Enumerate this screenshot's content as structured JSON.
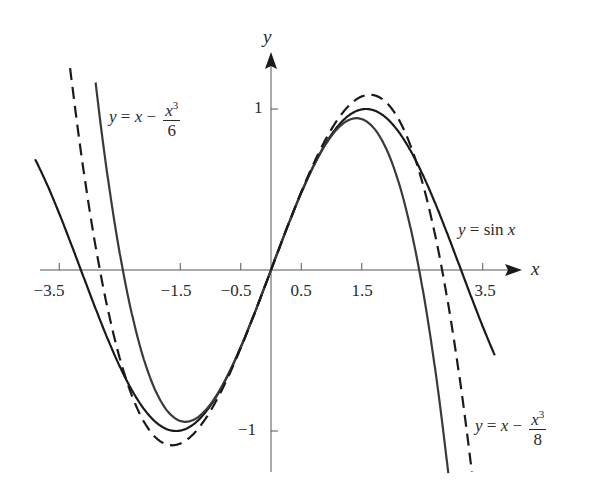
{
  "chart_data": {
    "type": "line",
    "title": "",
    "xlabel": "x",
    "ylabel": "y",
    "xlim": [
      -3.9,
      4.0
    ],
    "ylim": [
      -1.3,
      1.35
    ],
    "grid": false,
    "legend": "inline annotations",
    "x_ticks": [
      -3.5,
      -1.5,
      -0.5,
      0.5,
      1.5,
      3.5
    ],
    "x_tick_labels": [
      "−3.5",
      "−1.5",
      "−0.5",
      "0.5",
      "1.5",
      "3.5"
    ],
    "y_ticks": [
      1,
      -1
    ],
    "y_tick_labels": [
      "1",
      "−1"
    ],
    "series": [
      {
        "name": "y = sin x",
        "expression": "sin(x)",
        "style": "solid",
        "color": "#1a1a1a",
        "x_range": [
          -3.9,
          3.7
        ]
      },
      {
        "name": "y = x − x^3/6",
        "expression": "x - x^3/6",
        "style": "solid",
        "color": "#3a3a3a",
        "x_range": [
          -2.9,
          2.95
        ]
      },
      {
        "name": "y = x − x^3/8",
        "expression": "x - x^3/8",
        "style": "dashed",
        "color": "#1a1a1a",
        "x_range": [
          -3.35,
          3.4
        ]
      }
    ],
    "annotations": [
      {
        "text": "y = x − x³/6",
        "near": [
          -2.6,
          0.9
        ]
      },
      {
        "text": "y = sin x",
        "near": [
          3.2,
          0.23
        ]
      },
      {
        "text": "y = x − x³/8",
        "near": [
          3.4,
          -1.0
        ]
      }
    ]
  },
  "labels": {
    "x_axis": "x",
    "y_axis": "y",
    "x_ticks": [
      "−3.5",
      "−1.5",
      "−0.5",
      "0.5",
      "1.5",
      "3.5"
    ],
    "y_ticks": [
      "1",
      "−1"
    ],
    "sin": {
      "lhs": "y",
      "eq": " = sin ",
      "var": "x"
    },
    "cubic6": {
      "lhs": "y",
      "eq": " = ",
      "x": "x",
      "minus": " − ",
      "num": "x",
      "exp": "3",
      "den": "6"
    },
    "cubic8": {
      "lhs": "y",
      "eq": " = ",
      "x": "x",
      "minus": " − ",
      "num": "x",
      "exp": "3",
      "den": "8"
    }
  }
}
